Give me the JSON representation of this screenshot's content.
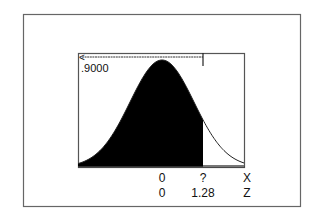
{
  "chart_data": {
    "type": "area",
    "title": "",
    "shaded_region": "left",
    "shaded_area": 0.9,
    "area_label": ".9000",
    "area_arrow": "<-",
    "x_axis": {
      "label": "X",
      "ticks": [
        {
          "position_z": 0,
          "label": "0"
        },
        {
          "position_z": 1.28,
          "label": "?"
        }
      ]
    },
    "z_axis": {
      "label": "Z",
      "ticks": [
        {
          "position_z": 0,
          "label": "0"
        },
        {
          "position_z": 1.28,
          "label": "1.28"
        }
      ]
    },
    "mean": 0,
    "sd": 1,
    "cutoff_z": 1.28,
    "xlim": [
      -3,
      3
    ],
    "grid": false,
    "legend": null
  },
  "colors": {
    "frame": "#555555",
    "fill": "#000000",
    "curve": "#222222",
    "text": "#111111",
    "background": "#ffffff"
  }
}
